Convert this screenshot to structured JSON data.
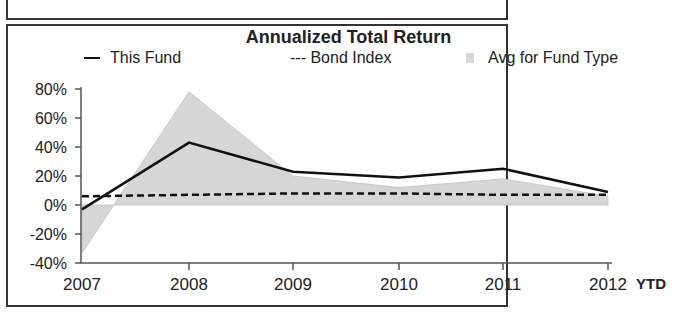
{
  "chart_data": {
    "type": "line",
    "title": "Annualized Total Return",
    "categories": [
      "2007",
      "2008",
      "2009",
      "2010",
      "2011",
      "2012"
    ],
    "x_suffix_label": "YTD",
    "xlabel": "",
    "ylabel": "",
    "ylim": [
      -40,
      80
    ],
    "y_ticks": [
      "80%",
      "60%",
      "40%",
      "20%",
      "0%",
      "-20%",
      "-40%"
    ],
    "grid": false,
    "legend_position": "top",
    "series": [
      {
        "name": "This Fund",
        "style": "solid line",
        "values": [
          -3,
          43,
          23,
          19,
          25,
          9
        ]
      },
      {
        "name": "Bond Index",
        "style": "dashed line",
        "values": [
          6,
          7,
          8,
          8,
          7,
          7
        ]
      },
      {
        "name": "Avg for Fund Type",
        "style": "shaded area",
        "values": [
          -33,
          78,
          20,
          12,
          18,
          6
        ]
      }
    ]
  },
  "legend": {
    "this_fund": "This Fund",
    "bond_index": "--- Bond Index",
    "avg_fund_type": "Avg for Fund Type"
  },
  "colors": {
    "fund_line": "#111111",
    "bond_line": "#111111",
    "avg_area": "#d6d6d6",
    "frame": "#333333"
  }
}
